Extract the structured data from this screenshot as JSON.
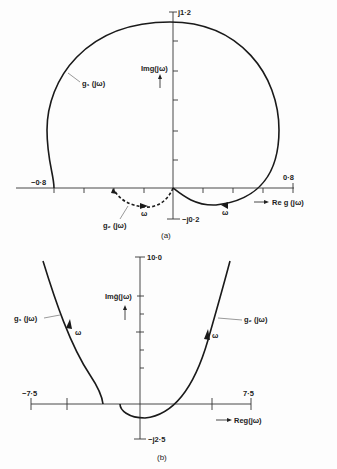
{
  "figure_a": {
    "caption": "(a)",
    "y_top_label": "j1·2",
    "y_bottom_label": "−j0·2",
    "x_left_label": "−0·8",
    "x_right_label": "0·8",
    "y_axis_label": "Img(jω)",
    "x_axis_label": "Re g (jω)",
    "curve1_label": "g₁ (jω)",
    "curve2_label": "g₂ (jω)",
    "omega_label": "ω"
  },
  "figure_b": {
    "caption": "(b)",
    "y_top_label": "10·0",
    "y_bottom_label": "−j2·5",
    "x_left_label": "−7·5",
    "x_right_label": "7·5",
    "y_axis_label": "Imĝ(jω)",
    "x_axis_label": "Reg(jω)",
    "curve1_label": "g₁ (jω)",
    "curve2_label": "g₂ (jω)",
    "omega_label": "ω"
  }
}
